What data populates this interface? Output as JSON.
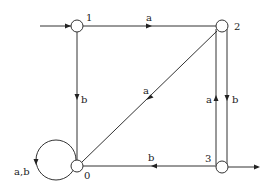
{
  "diagram": {
    "type": "finite-automaton",
    "nodes": [
      {
        "id": "1",
        "label": "1",
        "initial": true
      },
      {
        "id": "2",
        "label": "2"
      },
      {
        "id": "3",
        "label": "3",
        "final": true
      },
      {
        "id": "0",
        "label": "0"
      }
    ],
    "edges": [
      {
        "from": "1",
        "to": "2",
        "label": "a"
      },
      {
        "from": "1",
        "to": "0",
        "label": "b"
      },
      {
        "from": "2",
        "to": "0",
        "label": "a"
      },
      {
        "from": "2",
        "to": "3",
        "label": "b"
      },
      {
        "from": "3",
        "to": "2",
        "label": "a"
      },
      {
        "from": "3",
        "to": "0",
        "label": "b"
      },
      {
        "from": "0",
        "to": "0",
        "label": "a,b"
      }
    ]
  }
}
